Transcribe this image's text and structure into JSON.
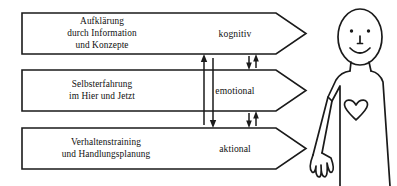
{
  "diagram": {
    "type": "process-arrows",
    "colors": {
      "ink": "#1a1a1a",
      "background": "#ffffff"
    },
    "arrows": [
      {
        "id": "kognitiv",
        "lines": [
          "Aufklärung",
          "durch Information",
          "und Konzepte"
        ],
        "label": "kognitiv"
      },
      {
        "id": "emotional",
        "lines": [
          "Selbsterfahrung",
          "im Hier und Jetzt"
        ],
        "label": "emotional"
      },
      {
        "id": "aktional",
        "lines": [
          "Verhaltenstraining",
          "und Handlungsplanung"
        ],
        "label": "aktional"
      }
    ],
    "connectors": [
      {
        "id": "long-bidirectional-span",
        "orientation": "vertical",
        "direction": "both",
        "span": "arrow1-to-arrow3"
      },
      {
        "id": "short-pair-upper",
        "orientation": "vertical",
        "direction": "both",
        "span": "arrow1-to-arrow2"
      },
      {
        "id": "short-pair-lower",
        "orientation": "vertical",
        "direction": "both",
        "span": "arrow2-to-arrow3"
      }
    ],
    "figure": {
      "id": "person-figure",
      "parts": [
        "head",
        "eye-left",
        "eye-right",
        "nose",
        "smile",
        "neck",
        "torso",
        "arm",
        "hand",
        "heart"
      ]
    }
  }
}
